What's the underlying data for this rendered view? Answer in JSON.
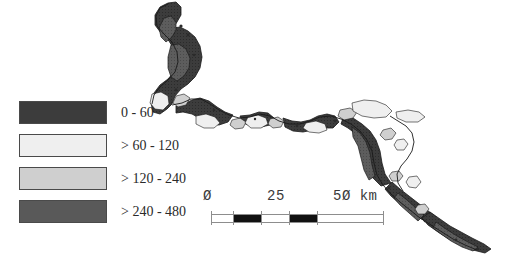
{
  "map": {
    "title": "",
    "feature_name": "river-corridor-choropleth",
    "classes": [
      {
        "id": "class-1",
        "label": "0 - 60",
        "color": "#3c3c3c"
      },
      {
        "id": "class-2",
        "label": "> 60 - 120",
        "color": "#efefef"
      },
      {
        "id": "class-3",
        "label": "> 120 - 240",
        "color": "#cfcfcf"
      },
      {
        "id": "class-4",
        "label": "> 240 - 480",
        "color": "#595959"
      }
    ],
    "outline_color": "#1a1a1a",
    "background_color": "#ffffff"
  },
  "legend": {
    "name": "map-legend",
    "items": [
      {
        "swatch_class": "fill-c1",
        "label": "0 - 60"
      },
      {
        "swatch_class": "fill-c2",
        "label": "> 60 - 120"
      },
      {
        "swatch_class": "fill-c3",
        "label": "> 120 - 240"
      },
      {
        "swatch_class": "fill-c4",
        "label": "> 240 - 480"
      }
    ]
  },
  "scalebar": {
    "name": "distance-scale-bar",
    "unit": "km",
    "tick_labels": [
      "Ø",
      "25",
      "5Ø km"
    ],
    "min": 0,
    "mid": 25,
    "max": 50,
    "bar_color": "#111111",
    "frame_color": "#8d8d8d"
  }
}
